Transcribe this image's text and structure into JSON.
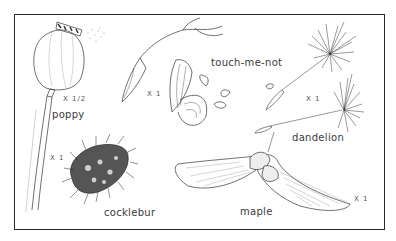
{
  "plate": {
    "specimens": [
      {
        "name": "poppy",
        "scale": "X 1/2"
      },
      {
        "name": "touch-me-not",
        "scale": "X 1"
      },
      {
        "name": "dandelion",
        "scale": "X 1"
      },
      {
        "name": "cocklebur",
        "scale": "X 1"
      },
      {
        "name": "maple",
        "scale": "X 1"
      }
    ]
  },
  "colors": {
    "ink": "#2a2a2a",
    "paper": "#ffffff"
  }
}
